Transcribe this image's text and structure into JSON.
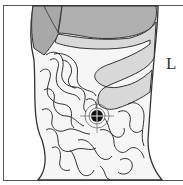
{
  "diagram": {
    "type": "anatomical-abdomen",
    "side_label": "L",
    "marker": {
      "name": "target-point",
      "cx": 97,
      "cy": 116
    },
    "organs": [
      {
        "name": "liver",
        "fill": "#a8a8a8"
      },
      {
        "name": "stomach",
        "fill": "#b4b4b4"
      },
      {
        "name": "transverse-colon",
        "fill": "#d6d6d6"
      },
      {
        "name": "small-intestine",
        "fill": "#ffffff"
      }
    ],
    "colors": {
      "outline": "#333333",
      "body": "#f4f4f4",
      "marker": "#111111"
    }
  }
}
